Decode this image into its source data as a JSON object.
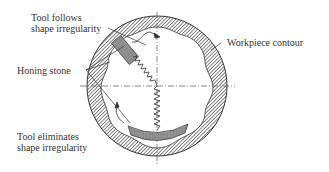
{
  "labels": {
    "tool_follows_line1": "Tool follows",
    "tool_follows_line2": "shape irregularity",
    "honing_stone": "Honing stone",
    "workpiece_contour": "Workpiece contour",
    "tool_eliminates_line1": "Tool eliminates",
    "tool_eliminates_line2": "shape irregularity"
  },
  "colors": {
    "hatch": "#555555",
    "stone": "#8a8a8a",
    "line": "#333333"
  }
}
